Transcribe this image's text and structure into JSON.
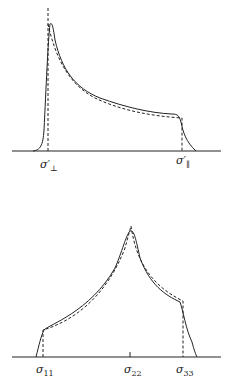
{
  "figure": {
    "panels": [
      {
        "id": "axial",
        "labels": [
          {
            "symbol": "σ",
            "sub": "⊥",
            "prime": "′"
          },
          {
            "symbol": "σ",
            "sub": "∥",
            "prime": "′"
          }
        ]
      },
      {
        "id": "non-axial",
        "labels": [
          {
            "symbol": "σ",
            "sub": "11"
          },
          {
            "symbol": "σ",
            "sub": "22"
          },
          {
            "symbol": "σ",
            "sub": "33"
          }
        ]
      }
    ],
    "legend": {
      "solid": "broadened powder lineshape",
      "dashed": "ideal powder pattern"
    },
    "colors": {
      "line": "#222222",
      "background": "#ffffff"
    }
  }
}
